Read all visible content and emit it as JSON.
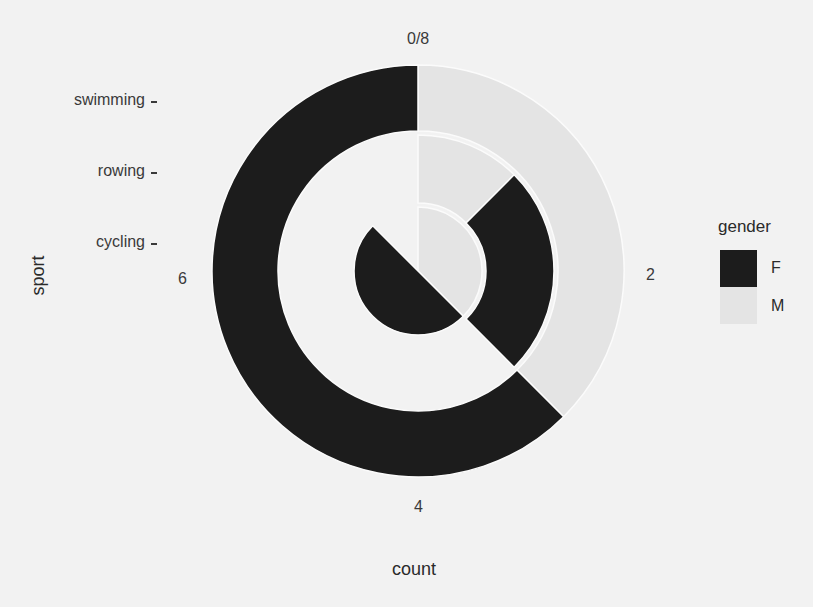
{
  "chart_data": {
    "type": "bar",
    "subtype": "stacked-bar-coord-polar",
    "title": "",
    "xlabel": "count",
    "ylabel": "sport",
    "categories": [
      "cycling",
      "rowing",
      "swimming"
    ],
    "series": [
      {
        "name": "F",
        "values": [
          4,
          2,
          5
        ],
        "color": "#1c1c1c"
      },
      {
        "name": "M",
        "values": [
          3,
          1,
          3
        ],
        "color": "#e4e4e4"
      }
    ],
    "theta_axis": {
      "label": "count",
      "ticks": [
        "0/8",
        "2",
        "4",
        "6"
      ],
      "range": [
        0,
        8
      ]
    },
    "radial_axis": {
      "label": "sport",
      "ticks": [
        "swimming",
        "rowing",
        "cycling"
      ]
    },
    "legend": {
      "title": "gender",
      "entries": [
        "F",
        "M"
      ],
      "position": "right"
    },
    "grid": false
  },
  "labels": {
    "theta_ticks": [
      {
        "text": "0/8",
        "x": 407,
        "y": 30
      },
      {
        "text": "2",
        "x": 646,
        "y": 266
      },
      {
        "text": "4",
        "x": 414,
        "y": 498
      },
      {
        "text": "6",
        "x": 178,
        "y": 270
      }
    ],
    "sport_ticks": [
      {
        "text": "swimming",
        "y": 91
      },
      {
        "text": "rowing",
        "y": 162
      },
      {
        "text": "cycling",
        "y": 233
      }
    ],
    "x_title": "count",
    "y_title": "sport",
    "legend_title": "gender",
    "legend_F": "F",
    "legend_M": "M"
  },
  "colors": {
    "F": "#1c1c1c",
    "M": "#e4e4e4",
    "panel_bg": "#f2f2f2",
    "gap": "#fbfbfb"
  }
}
